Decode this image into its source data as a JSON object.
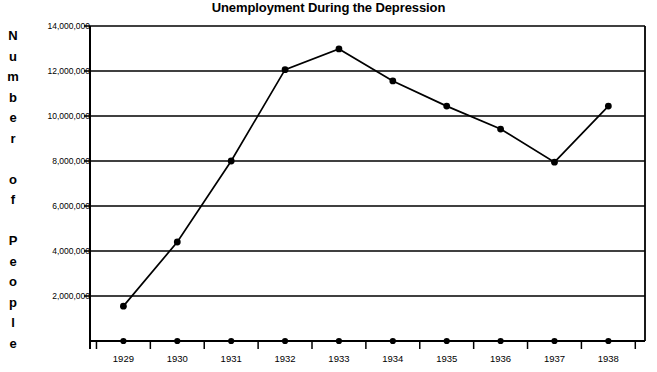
{
  "chart_data": {
    "type": "line",
    "title": "Unemployment During the Depression",
    "xlabel": "",
    "ylabel": "Number of People",
    "categories": [
      "1929",
      "1930",
      "1931",
      "1932",
      "1933",
      "1934",
      "1935",
      "1936",
      "1937",
      "1938"
    ],
    "values": [
      1550000,
      4400000,
      8000000,
      12060000,
      12980000,
      11560000,
      10440000,
      9420000,
      7950000,
      10440000
    ],
    "series": [
      {
        "name": "Unemployed",
        "values": [
          1550000,
          4400000,
          8000000,
          12060000,
          12980000,
          11560000,
          10440000,
          9420000,
          7950000,
          10440000
        ]
      },
      {
        "name": "axis-markers",
        "values": [
          0,
          0,
          0,
          0,
          0,
          0,
          0,
          0,
          0,
          0
        ]
      }
    ],
    "ylim": [
      0,
      14000000
    ],
    "ytick_values": [
      2000000,
      4000000,
      6000000,
      8000000,
      10000000,
      12000000,
      14000000
    ],
    "ytick_labels": [
      "2,000,000",
      "4,000,000",
      "6,000,000",
      "8,000,000",
      "10,000,000",
      "12,000,000",
      "14,000,000"
    ],
    "grid": true,
    "grid_axis": "y",
    "legend": "none",
    "legend_position": "none",
    "marker": "filled-circle",
    "line_color": "#000000",
    "marker_color": "#000000",
    "grid_color": "#000000",
    "background_color": "#ffffff"
  },
  "axis_title_letters": [
    "N",
    "u",
    "m",
    "b",
    "e",
    "r",
    "",
    "o",
    "f",
    "",
    "P",
    "e",
    "o",
    "p",
    "l",
    "e"
  ]
}
